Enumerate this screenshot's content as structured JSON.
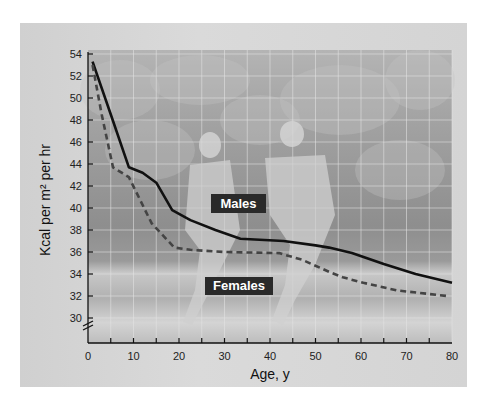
{
  "chart_data": {
    "type": "line",
    "title": "",
    "xlabel": "Age, y",
    "ylabel": "Kcal per m² per hr",
    "xlim": [
      0,
      80
    ],
    "ylim": [
      29,
      54
    ],
    "x_ticks": [
      0,
      10,
      20,
      30,
      40,
      50,
      60,
      70,
      80
    ],
    "y_ticks": [
      30,
      32,
      34,
      36,
      38,
      40,
      42,
      44,
      46,
      48,
      50,
      52,
      54
    ],
    "axis_break": "y-axis break between 29 and 30",
    "grid": true,
    "background": "photograph of two joggers",
    "series": [
      {
        "name": "Males",
        "style": "solid",
        "color": "#111111",
        "x": [
          1,
          5,
          9,
          12,
          15,
          18.5,
          22.5,
          28,
          33.5,
          43,
          50,
          53,
          58,
          65,
          72,
          80
        ],
        "y": [
          53.3,
          48.5,
          43.7,
          43.2,
          42.3,
          39.8,
          38.9,
          38.0,
          37.2,
          37.0,
          36.6,
          36.4,
          35.9,
          34.9,
          34.0,
          33.2
        ]
      },
      {
        "name": "Females",
        "style": "dashed",
        "color": "#444444",
        "x": [
          1,
          3,
          5.5,
          9,
          14,
          19,
          22.5,
          30,
          42,
          47,
          53,
          56,
          60.5,
          68,
          79
        ],
        "y": [
          53.0,
          48.5,
          43.7,
          42.8,
          38.6,
          36.4,
          36.2,
          36.0,
          35.9,
          35.3,
          34.2,
          33.7,
          33.2,
          32.5,
          32.0
        ]
      }
    ],
    "annotations": [
      {
        "text": "Males",
        "x": 43,
        "y": 39.6
      },
      {
        "text": "Females",
        "x": 43,
        "y": 33.3
      }
    ]
  },
  "labels": {
    "xlabel": "Age, y",
    "ylabel": "Kcal per m² per hr",
    "males": "Males",
    "females": "Females"
  }
}
